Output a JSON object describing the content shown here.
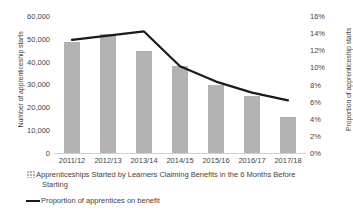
{
  "chart_data": {
    "type": "bar",
    "title": "",
    "categories": [
      "2011/12",
      "2012/13",
      "2013/14",
      "2014/15",
      "2015/16",
      "2016/17",
      "2017/18"
    ],
    "series": [
      {
        "name": "Apprenticeships Started by Learners Claiming Benefits in the 6 Months Before Starting",
        "type": "bar",
        "axis": "left",
        "values": [
          49000,
          52500,
          45000,
          38400,
          30000,
          25100,
          15900
        ]
      },
      {
        "name": "Proportion of apprentices on benefit",
        "type": "line",
        "axis": "right",
        "values": [
          13.3,
          13.8,
          14.3,
          10.2,
          8.4,
          7.1,
          6.2
        ]
      }
    ],
    "xlabel": "",
    "ylabel": "Number of apprenticeship starts",
    "y2label": "Proportion of apprenticeship starts",
    "ylim": [
      0,
      60000
    ],
    "y2lim": [
      0,
      16
    ],
    "ytick_labels": [
      "60,000",
      "50,000",
      "40,000",
      "30,000",
      "20,000",
      "10,000",
      "0"
    ],
    "y2tick_labels": [
      "16%",
      "14%",
      "12%",
      "10%",
      "8%",
      "6%",
      "4%",
      "2%",
      "0%"
    ],
    "grid": false,
    "legend_position": "bottom"
  },
  "axes": {
    "left_title": "Number of apprenticeship starts",
    "right_title": "Proportion of apprenticeship starts",
    "left_ticks": [
      "60,000",
      "50,000",
      "40,000",
      "30,000",
      "20,000",
      "10,000",
      "0"
    ],
    "right_ticks": [
      "16%",
      "14%",
      "12%",
      "10%",
      "8%",
      "6%",
      "4%",
      "2%",
      "0%"
    ]
  },
  "legend": {
    "bar_label_line1": "Apprenticeships Started by Learners Claiming Benefits in the 6 Months Before",
    "bar_label_line2": "Starting",
    "line_label": "Proportion of apprentices on benefit"
  },
  "colors": {
    "bar_fill": "#b3b3b3",
    "line_stroke": "#1a1a1a",
    "text": "#3f3f3f",
    "background": "#ffffff"
  }
}
